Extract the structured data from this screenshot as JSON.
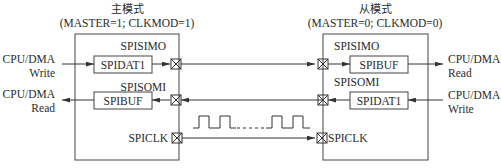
{
  "master": {
    "title": "主模式",
    "config": "(MASTER=1; CLKMOD=1)",
    "simo_label": "SPISIMO",
    "somi_label": "SPISOMI",
    "clk_label": "SPICLK",
    "tx_register": "SPIDAT1",
    "rx_register": "SPIBUF",
    "write_source_line1": "CPU/DMA",
    "write_source_line2": "Write",
    "read_target_line1": "CPU/DMA",
    "read_target_line2": "Read"
  },
  "slave": {
    "title": "从模式",
    "config": "(MASTER=0; CLKMOD=0)",
    "simo_label": "SPISIMO",
    "somi_label": "SPISOMI",
    "clk_label": "SPICLK",
    "rx_register": "SPIBUF",
    "tx_register": "SPIDAT1",
    "read_target_line1": "CPU/DMA",
    "read_target_line2": "Read",
    "write_source_line1": "CPU/DMA",
    "write_source_line2": "Write"
  },
  "clock": {
    "waveform": "square-wave-clock",
    "ellipsis": "......"
  },
  "colors": {
    "line": "#333333",
    "text": "#2a2a2a",
    "background": "#ffffff"
  }
}
